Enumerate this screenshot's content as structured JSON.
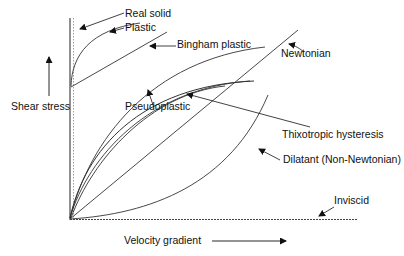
{
  "diagram": {
    "axes": {
      "y_label": "Shear stress",
      "x_label": "Velocity gradient"
    },
    "curves": [
      {
        "id": "real-solid",
        "label": "Real solid"
      },
      {
        "id": "plastic",
        "label": "Plastic"
      },
      {
        "id": "bingham",
        "label": "Bingham plastic"
      },
      {
        "id": "newtonian",
        "label": "Newtonian"
      },
      {
        "id": "pseudoplastic",
        "label": "Pseudoplastic"
      },
      {
        "id": "thixotropic",
        "label": "Thixotropic hysteresis"
      },
      {
        "id": "dilatant",
        "label": "Dilatant (Non-Newtonian)"
      },
      {
        "id": "inviscid",
        "label": "Inviscid"
      }
    ],
    "colors": {
      "line": "#333333",
      "text": "#111111",
      "background": "#ffffff"
    }
  }
}
